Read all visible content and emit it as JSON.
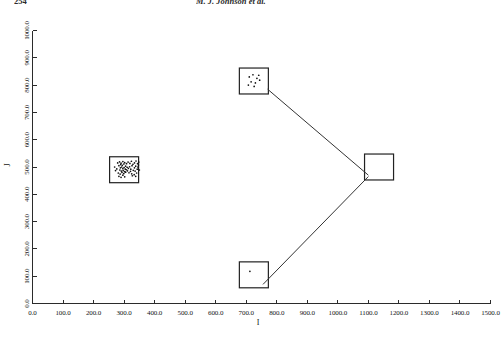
{
  "runhead": {
    "page_number": "254",
    "authors": "M. J. Johnson et al."
  },
  "chart_data": {
    "type": "scatter",
    "title": "",
    "subtitle": "",
    "xlabel": "I",
    "ylabel": "J",
    "xlim": [
      0,
      1500
    ],
    "ylim": [
      0,
      1000
    ],
    "grid": false,
    "legend": "none",
    "xticks": [
      "0.0",
      "100.0",
      "200.0",
      "300.0",
      "400.0",
      "500.0",
      "600.0",
      "700.0",
      "800.0",
      "900.0",
      "1000.0",
      "1100.0",
      "1200.0",
      "1300.0",
      "1400.0",
      "1500.0"
    ],
    "xtickvalues": [
      0,
      100,
      200,
      300,
      400,
      500,
      600,
      700,
      800,
      900,
      1000,
      1100,
      1200,
      1300,
      1400,
      1500
    ],
    "yticks": [
      "0.0",
      "100.0",
      "200.0",
      "300.0",
      "400.0",
      "500.0",
      "600.0",
      "700.0",
      "800.0",
      "900.0",
      "1000.0"
    ],
    "ytickvalues": [
      0,
      100,
      200,
      300,
      400,
      500,
      600,
      700,
      800,
      900,
      1000
    ],
    "regions": [
      {
        "name": "cluster-box-left",
        "x_center": 300,
        "y_center": 490,
        "width": 95,
        "height": 95,
        "point_count": 62,
        "density": "dense"
      },
      {
        "name": "cluster-box-top",
        "x_center": 725,
        "y_center": 815,
        "width": 95,
        "height": 95,
        "point_count": 9,
        "density": "sparse"
      },
      {
        "name": "cluster-box-right",
        "x_center": 1135,
        "y_center": 500,
        "width": 95,
        "height": 95,
        "point_count": 0,
        "density": "empty"
      },
      {
        "name": "cluster-box-bottom",
        "x_center": 725,
        "y_center": 105,
        "width": 95,
        "height": 95,
        "point_count": 1,
        "density": "empty"
      }
    ],
    "connectors": [
      {
        "name": "top-to-right",
        "from": [
          770,
          785
        ],
        "to": [
          1100,
          470
        ]
      },
      {
        "name": "right-to-bottom",
        "from": [
          1100,
          465
        ],
        "to": [
          755,
          70
        ]
      }
    ],
    "series": [
      {
        "name": "left-cluster-points",
        "points": [
          [
            288,
            497
          ],
          [
            292,
            500
          ],
          [
            296,
            494
          ],
          [
            300,
            498
          ],
          [
            304,
            492
          ],
          [
            286,
            489
          ],
          [
            291,
            485
          ],
          [
            297,
            487
          ],
          [
            302,
            483
          ],
          [
            308,
            490
          ],
          [
            283,
            505
          ],
          [
            289,
            509
          ],
          [
            294,
            506
          ],
          [
            299,
            511
          ],
          [
            305,
            503
          ],
          [
            310,
            499
          ],
          [
            314,
            495
          ],
          [
            318,
            501
          ],
          [
            322,
            492
          ],
          [
            326,
            505
          ],
          [
            281,
            478
          ],
          [
            287,
            474
          ],
          [
            293,
            480
          ],
          [
            299,
            476
          ],
          [
            305,
            481
          ],
          [
            311,
            486
          ],
          [
            316,
            479
          ],
          [
            321,
            484
          ],
          [
            325,
            475
          ],
          [
            330,
            488
          ],
          [
            279,
            515
          ],
          [
            285,
            519
          ],
          [
            290,
            514
          ],
          [
            296,
            520
          ],
          [
            302,
            516
          ],
          [
            308,
            512
          ],
          [
            313,
            518
          ],
          [
            319,
            513
          ],
          [
            324,
            521
          ],
          [
            329,
            510
          ],
          [
            334,
            497
          ],
          [
            338,
            503
          ],
          [
            343,
            492
          ],
          [
            347,
            507
          ],
          [
            336,
            485
          ],
          [
            341,
            478
          ],
          [
            345,
            500
          ],
          [
            350,
            489
          ],
          [
            276,
            493
          ],
          [
            272,
            487
          ],
          [
            269,
            500
          ],
          [
            334,
            515
          ],
          [
            339,
            522
          ],
          [
            344,
            512
          ],
          [
            348,
            518
          ],
          [
            327,
            468
          ],
          [
            333,
            472
          ],
          [
            338,
            466
          ],
          [
            283,
            466
          ],
          [
            290,
            462
          ],
          [
            296,
            470
          ],
          [
            302,
            464
          ]
        ]
      },
      {
        "name": "top-cluster-points",
        "points": [
          [
            710,
            830
          ],
          [
            722,
            838
          ],
          [
            735,
            825
          ],
          [
            716,
            812
          ],
          [
            730,
            808
          ],
          [
            744,
            818
          ],
          [
            707,
            800
          ],
          [
            726,
            795
          ],
          [
            741,
            836
          ]
        ]
      },
      {
        "name": "bottom-cluster-points",
        "points": [
          [
            712,
            118
          ]
        ]
      }
    ]
  },
  "colors": {
    "axis": "#2b2b2b",
    "box": "#222222",
    "connector": "#333333",
    "point": "#111111",
    "background": "#ffffff"
  }
}
